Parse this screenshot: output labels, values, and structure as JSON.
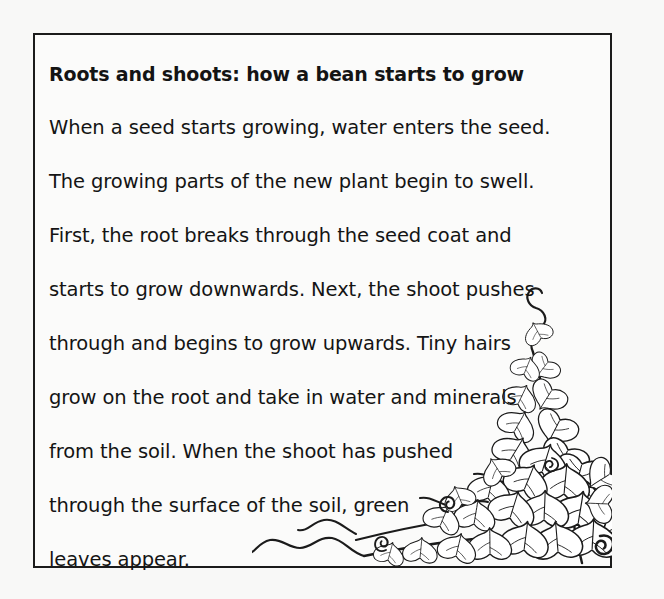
{
  "page": {
    "background_color": "#f8f8f7",
    "ink_color": "#141414"
  },
  "text_box": {
    "border_color": "#1b1b1b",
    "fill_color": "#fbfbfa"
  },
  "passage": {
    "title": "Roots and shoots: how a bean starts to grow",
    "lines": [
      "When a seed starts growing, water enters the seed.",
      "The growing parts of the new plant begin to swell.",
      "First, the root breaks through the seed coat and",
      "starts to grow downwards. Next, the shoot pushes",
      "through and begins to grow upwards. Tiny hairs",
      "grow on the root and take in water and minerals",
      "from the soil. When the shoot has pushed",
      "through the surface of the soil, green",
      "leaves appear."
    ]
  },
  "illustration": {
    "name": "bean-vine-leaves-drawing",
    "description": "Line drawing of a climbing bean vine with heart-shaped leaves and curling tendrils in the lower-right corner",
    "stroke_color": "#1b1b1b"
  }
}
